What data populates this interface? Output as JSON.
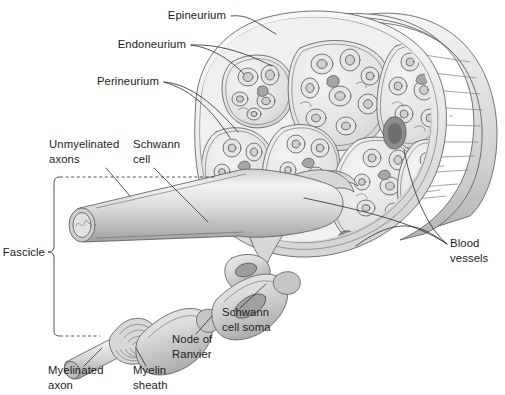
{
  "figure": {
    "background_color": "#ffffff",
    "width": 505,
    "height": 395
  },
  "palette": {
    "outline": "#5d5d5d",
    "leader_line": "#2a2a2a",
    "label_text": "#1b1b1b",
    "tissue_light": "#ededed",
    "tissue_mid": "#dcdcdc",
    "tissue_dark": "#c2c2c2",
    "sheath_shadow": "#a8a8a8",
    "vessel_dark": "#888888",
    "nucleus": "#9a9a9a",
    "trunk_highlight": "#f2f2f2"
  },
  "labels": [
    {
      "id": "epineurium",
      "lines": [
        "Epineurium"
      ],
      "x": 226,
      "y": 19,
      "align": "end"
    },
    {
      "id": "endoneurium",
      "lines": [
        "Endoneurium"
      ],
      "x": 186,
      "y": 48,
      "align": "end"
    },
    {
      "id": "perineurium",
      "lines": [
        "Perineurium"
      ],
      "x": 159,
      "y": 85,
      "align": "end"
    },
    {
      "id": "unmyelinated-axons",
      "lines": [
        "Unmyelinated",
        "axons"
      ],
      "x": 49,
      "y": 148,
      "align": "start"
    },
    {
      "id": "schwann-cell",
      "lines": [
        "Schwann",
        "cell"
      ],
      "x": 133,
      "y": 148,
      "align": "start"
    },
    {
      "id": "fascicle",
      "lines": [
        "Fascicle"
      ],
      "x": 45,
      "y": 256,
      "align": "end"
    },
    {
      "id": "blood-vessels",
      "lines": [
        "Blood",
        "vessels"
      ],
      "x": 450,
      "y": 247,
      "align": "start"
    },
    {
      "id": "schwann-cell-soma",
      "lines": [
        "Schwann",
        "cell soma"
      ],
      "x": 222,
      "y": 316,
      "align": "start"
    },
    {
      "id": "node-of-ranvier",
      "lines": [
        "Node of",
        "Ranvier"
      ],
      "x": 172,
      "y": 343,
      "align": "start"
    },
    {
      "id": "myelinated-axon",
      "lines": [
        "Myelinated",
        "axon"
      ],
      "x": 48,
      "y": 374,
      "align": "start"
    },
    {
      "id": "myelin-sheath",
      "lines": [
        "Myelin",
        "sheath"
      ],
      "x": 133,
      "y": 374,
      "align": "start"
    }
  ],
  "structures": {
    "nerve_trunk": "cut nerve trunk shown in three-quarter view with cut face at left and shaft receding to the right",
    "fascicles_visible": 7,
    "blood_vessels_visible": 3,
    "cut_face_description": "transverse section through nerve showing fascicles bundled within epineurium",
    "magnified_inset": "enlarged unmyelinated axon bundle and myelinated axon with myelin sheath, node of Ranvier and Schwann cell soma"
  }
}
